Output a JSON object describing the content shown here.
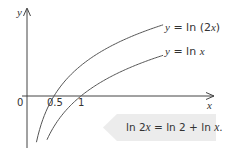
{
  "chart_data": {
    "type": "line",
    "title": "",
    "xlabel": "x",
    "ylabel": "y",
    "x_ticks": [
      {
        "value": 0,
        "label": "0"
      },
      {
        "value": 0.5,
        "label": "0.5"
      },
      {
        "value": 1,
        "label": "1"
      }
    ],
    "series": [
      {
        "name": "y = ln (2x)",
        "function": "ln(2x)",
        "x_intercept": 0.5,
        "color": "#555555"
      },
      {
        "name": "y = ln x",
        "function": "ln(x)",
        "x_intercept": 1,
        "color": "#555555"
      }
    ],
    "xlim": [
      0,
      2.5
    ],
    "grid": false,
    "annotation": "ln 2x = ln 2 + ln x."
  },
  "labels": {
    "y_axis": "y",
    "x_axis": "x",
    "origin": "0",
    "tick_half": "0.5",
    "tick_one": "1",
    "curve1_prefix": "y",
    "curve1_eq": " = ln (2",
    "curve1_var": "x",
    "curve1_close": ")",
    "curve2_prefix": "y",
    "curve2_eq": " = ln ",
    "curve2_var": "x"
  },
  "callout": {
    "text": "ln 2x = ln 2 + ln x.",
    "fill": "#ececec"
  },
  "colors": {
    "axis": "#444444",
    "curve": "#555555"
  }
}
